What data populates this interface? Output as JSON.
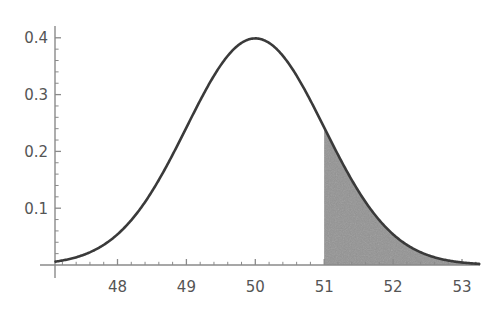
{
  "figure": {
    "title": "",
    "background_color": "#ffffff",
    "curve_color": "#3a3a3a",
    "axis_color": "#8a8a8a",
    "shade_color": "#9a9a9a",
    "tick_label_color": "#555555"
  },
  "chart_data": {
    "type": "line",
    "title": "",
    "subtitle": "",
    "xlabel": "",
    "ylabel": "",
    "xlim": [
      47.1,
      53.25
    ],
    "ylim": [
      0,
      0.425
    ],
    "grid": false,
    "legend": null,
    "distribution": {
      "name": "normal",
      "mean": 50,
      "sigma": 1,
      "peak_value": 0.4
    },
    "xticks": [
      48,
      49,
      50,
      51,
      52,
      53
    ],
    "xtick_labels": [
      "48",
      "49",
      "50",
      "51",
      "52",
      "53"
    ],
    "yticks": [
      0.1,
      0.2,
      0.3,
      0.4
    ],
    "ytick_labels": [
      "0.1",
      "0.2",
      "0.3",
      "0.4"
    ],
    "minor_tick_step_x": 0.2,
    "minor_tick_step_y": 0.02,
    "shaded_region": {
      "label": "right tail",
      "from": 51,
      "to": 53.25,
      "boundary_height": 0.242,
      "area": 0.1587
    },
    "series": [
      {
        "name": "normal pdf",
        "x": [
          47.1,
          47.25,
          47.4,
          47.55,
          47.7,
          47.85,
          48.0,
          48.15,
          48.3,
          48.45,
          48.6,
          48.75,
          48.9,
          49.05,
          49.2,
          49.35,
          49.5,
          49.65,
          49.8,
          49.95,
          50.0,
          50.05,
          50.2,
          50.35,
          50.5,
          50.65,
          50.8,
          50.95,
          51.0,
          51.15,
          51.3,
          51.45,
          51.6,
          51.75,
          51.9,
          52.05,
          52.2,
          52.35,
          52.5,
          52.65,
          52.8,
          52.95,
          53.1,
          53.25
        ],
        "y": [
          0.0077,
          0.0113,
          0.0163,
          0.0229,
          0.0316,
          0.0425,
          0.054,
          0.068,
          0.0833,
          0.0989,
          0.1182,
          0.1394,
          0.1604,
          0.1826,
          0.2036,
          0.2251,
          0.242,
          0.2672,
          0.2897,
          0.3078,
          0.3989,
          0.3989,
          0.391,
          0.3752,
          0.3521,
          0.323,
          0.2897,
          0.2541,
          0.242,
          0.2059,
          0.1714,
          0.1394,
          0.1109,
          0.0863,
          0.0656,
          0.0488,
          0.0355,
          0.0252,
          0.0175,
          0.0119,
          0.0079,
          0.0051,
          0.0033,
          0.002
        ]
      }
    ]
  },
  "axes": {
    "x_axis_name": "horizontal-axis",
    "y_axis_name": "vertical-axis"
  }
}
